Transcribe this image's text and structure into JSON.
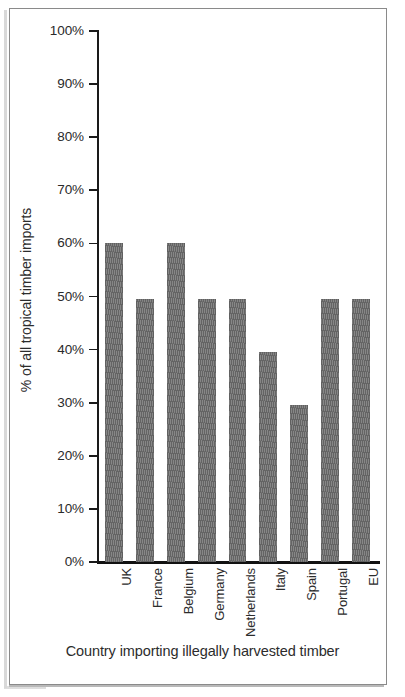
{
  "chart_data": {
    "type": "bar",
    "title": "",
    "xlabel": "Country importing illegally harvested timber",
    "ylabel": "% of all tropical timber imports",
    "categories": [
      "UK",
      "France",
      "Belgium",
      "Germany",
      "Netherlands",
      "Italy",
      "Spain",
      "Portugal",
      "EU"
    ],
    "values": [
      60,
      49.5,
      60,
      49.5,
      49.5,
      39.5,
      29.5,
      49.5,
      49.5
    ],
    "ylim": [
      0,
      100
    ],
    "ytick_values": [
      0,
      10,
      20,
      30,
      40,
      50,
      60,
      70,
      80,
      90,
      100
    ],
    "ytick_labels": [
      "0%",
      "10%",
      "20%",
      "30%",
      "40%",
      "50%",
      "60%",
      "70%",
      "80%",
      "90%",
      "100%"
    ],
    "grid": false,
    "legend": null,
    "bar_color": "#6f6f6f",
    "bar_fill_pattern": "diagonal-hatch",
    "axis_color": "#1a1a1a",
    "background_color": "#ffffff"
  },
  "figure": {
    "frame_border_color": "#8a8a8a",
    "has_outer_frame": true
  }
}
